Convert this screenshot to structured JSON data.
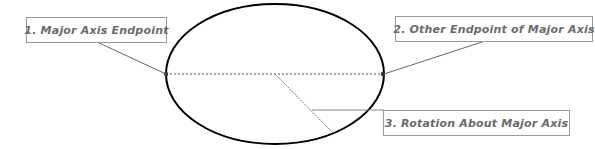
{
  "diagram": {
    "title": "",
    "labels": [
      {
        "id": "major-axis-endpoint",
        "text": "1. Major Axis Endpoint"
      },
      {
        "id": "other-endpoint",
        "text": "2. Other Endpoint of Major Axis"
      },
      {
        "id": "rotation",
        "text": "3. Rotation About Major Axis"
      }
    ],
    "colors": {
      "ellipse_stroke": "#000000",
      "leader_line": "#666666",
      "box_border": "#9a9a9a",
      "label_text": "#6a6a6a"
    }
  }
}
